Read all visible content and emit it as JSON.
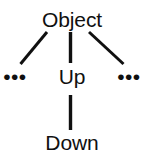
{
  "diagram": {
    "type": "class-hierarchy-tree",
    "background_color": "#ffffff",
    "stroke_color": "#101010",
    "text_color": "#101010",
    "nodes": [
      {
        "id": "object",
        "label": "Object"
      },
      {
        "id": "up",
        "label": "Up"
      },
      {
        "id": "down",
        "label": "Down"
      },
      {
        "id": "ellipsis_left",
        "label": "•••"
      },
      {
        "id": "ellipsis_right",
        "label": "•••"
      }
    ],
    "edges": [
      {
        "from": "object",
        "to": "ellipsis_left",
        "style": "diagonal-left"
      },
      {
        "from": "object",
        "to": "up",
        "style": "vertical"
      },
      {
        "from": "object",
        "to": "ellipsis_right",
        "style": "diagonal-right"
      },
      {
        "from": "up",
        "to": "down",
        "style": "vertical"
      }
    ]
  }
}
